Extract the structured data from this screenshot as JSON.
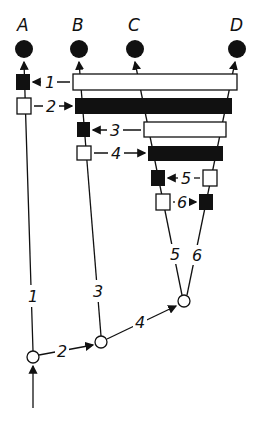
{
  "diagram": {
    "type": "cladogram-with-character-bars",
    "colors": {
      "ink": "#111111",
      "paper": "#ffffff"
    },
    "taxa": [
      {
        "label": "A"
      },
      {
        "label": "B"
      },
      {
        "label": "C"
      },
      {
        "label": "D"
      }
    ],
    "character_labels": [
      "1",
      "2",
      "3",
      "4",
      "5",
      "6"
    ],
    "branch_labels": [
      "1",
      "2",
      "3",
      "4",
      "5",
      "6"
    ]
  }
}
